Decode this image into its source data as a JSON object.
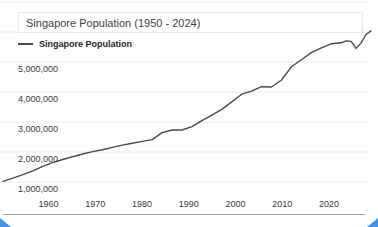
{
  "page": {
    "title": "Singapore Population (1950 - 2024)",
    "legend_label": "Singapore Population"
  },
  "colors": {
    "line": "#4a4a4a",
    "grid": "#ececec",
    "axis": "#9e9e9e",
    "handle": "#4a90e2"
  },
  "chart_data": {
    "type": "line",
    "title": "Singapore Population (1950 - 2024)",
    "xlabel": "",
    "ylabel": "",
    "legend_position": "top-left",
    "grid": true,
    "x_range": [
      1950,
      2024
    ],
    "y_gridline_values": [
      1000000,
      2000000,
      3000000,
      4000000,
      5000000,
      6000000,
      7000000
    ],
    "y_ticks": [
      {
        "value": 1000000,
        "label": "1,000,000"
      },
      {
        "value": 2000000,
        "label": "2,000,000"
      },
      {
        "value": 3000000,
        "label": "3,000,000"
      },
      {
        "value": 4000000,
        "label": "4,000,000"
      },
      {
        "value": 5000000,
        "label": "5,000,000"
      }
    ],
    "x_ticks": [
      {
        "year": 1960,
        "label": "1960"
      },
      {
        "year": 1970,
        "label": "1970"
      },
      {
        "year": 1980,
        "label": "1980"
      },
      {
        "year": 1990,
        "label": "1990"
      },
      {
        "year": 2000,
        "label": "2000"
      },
      {
        "year": 2010,
        "label": "2010"
      },
      {
        "year": 2020,
        "label": "2020"
      }
    ],
    "series": [
      {
        "name": "Singapore Population",
        "points": [
          {
            "year": 1950,
            "value": 1022100
          },
          {
            "year": 1952,
            "value": 1127000
          },
          {
            "year": 1954,
            "value": 1248100
          },
          {
            "year": 1956,
            "value": 1371600
          },
          {
            "year": 1958,
            "value": 1518800
          },
          {
            "year": 1960,
            "value": 1646400
          },
          {
            "year": 1962,
            "value": 1750200
          },
          {
            "year": 1964,
            "value": 1841600
          },
          {
            "year": 1966,
            "value": 1934400
          },
          {
            "year": 1968,
            "value": 2012000
          },
          {
            "year": 1970,
            "value": 2074500
          },
          {
            "year": 1972,
            "value": 2152400
          },
          {
            "year": 1974,
            "value": 2229800
          },
          {
            "year": 1976,
            "value": 2293300
          },
          {
            "year": 1978,
            "value": 2353600
          },
          {
            "year": 1980,
            "value": 2413900
          },
          {
            "year": 1982,
            "value": 2646500
          },
          {
            "year": 1984,
            "value": 2732000
          },
          {
            "year": 1986,
            "value": 2733400
          },
          {
            "year": 1988,
            "value": 2846100
          },
          {
            "year": 1990,
            "value": 3047100
          },
          {
            "year": 1992,
            "value": 3230700
          },
          {
            "year": 1994,
            "value": 3419000
          },
          {
            "year": 1996,
            "value": 3670700
          },
          {
            "year": 1998,
            "value": 3927200
          },
          {
            "year": 2000,
            "value": 4027900
          },
          {
            "year": 2002,
            "value": 4176000
          },
          {
            "year": 2004,
            "value": 4166700
          },
          {
            "year": 2006,
            "value": 4401400
          },
          {
            "year": 2008,
            "value": 4839400
          },
          {
            "year": 2010,
            "value": 5076700
          },
          {
            "year": 2012,
            "value": 5312400
          },
          {
            "year": 2014,
            "value": 5469700
          },
          {
            "year": 2016,
            "value": 5607300
          },
          {
            "year": 2018,
            "value": 5638700
          },
          {
            "year": 2019,
            "value": 5703600
          },
          {
            "year": 2020,
            "value": 5685800
          },
          {
            "year": 2021,
            "value": 5453600
          },
          {
            "year": 2022,
            "value": 5637000
          },
          {
            "year": 2023,
            "value": 5917600
          },
          {
            "year": 2024,
            "value": 6036900
          }
        ]
      }
    ]
  }
}
